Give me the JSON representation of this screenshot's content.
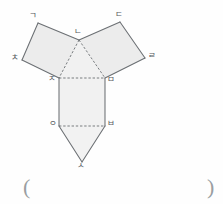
{
  "figure": {
    "kind": "net-of-solid-diagram",
    "stroke_color": "#6b6f73",
    "fill_color": "#ececec",
    "dashed_stroke_color": "#6b6f73",
    "label_color": "#54585c",
    "vertices": {
      "g": {
        "label": "ㄱ",
        "x": 38,
        "y": 23,
        "lx": 30,
        "ly": 12
      },
      "n": {
        "label": "ㄴ",
        "x": 79,
        "y": 40,
        "lx": 75,
        "ly": 28
      },
      "d": {
        "label": "ㄷ",
        "x": 120,
        "y": 22,
        "lx": 116,
        "ly": 11
      },
      "r": {
        "label": "ㄹ",
        "x": 145,
        "y": 58,
        "lx": 149,
        "ly": 52
      },
      "m": {
        "label": "ㅁ",
        "x": 105,
        "y": 78,
        "lx": 108,
        "ly": 79
      },
      "b": {
        "label": "ㅂ",
        "x": 105,
        "y": 126,
        "lx": 108,
        "ly": 120
      },
      "s": {
        "label": "ㅅ",
        "x": 82,
        "y": 162,
        "lx": 77,
        "ly": 160
      },
      "o": {
        "label": "ㅇ",
        "x": 59,
        "y": 126,
        "lx": 50,
        "ly": 120
      },
      "j": {
        "label": "ㅈ",
        "x": 59,
        "y": 78,
        "lx": 49,
        "ly": 77
      },
      "ch": {
        "label": "ㅊ",
        "x": 22,
        "y": 60,
        "lx": 12,
        "ly": 54
      }
    },
    "faces": [
      {
        "name": "left-parallelogram",
        "points": "38,23 79,40 59,78 22,60"
      },
      {
        "name": "right-parallelogram",
        "points": "120,22 145,58 105,78 79,40"
      },
      {
        "name": "center-triangle",
        "points": "79,40 59,78 105,78"
      },
      {
        "name": "center-rectangle",
        "points": "59,78 105,78 105,126 59,126"
      },
      {
        "name": "bottom-triangle",
        "points": "59,126 105,126 82,162"
      }
    ],
    "solid_edges": [
      {
        "name": "edge-g-n",
        "x1": 38,
        "y1": 23,
        "x2": 79,
        "y2": 40
      },
      {
        "name": "edge-g-ch",
        "x1": 38,
        "y1": 23,
        "x2": 22,
        "y2": 60
      },
      {
        "name": "edge-ch-j",
        "x1": 22,
        "y1": 60,
        "x2": 59,
        "y2": 78
      },
      {
        "name": "edge-n-d",
        "x1": 79,
        "y1": 40,
        "x2": 120,
        "y2": 22
      },
      {
        "name": "edge-d-r",
        "x1": 120,
        "y1": 22,
        "x2": 145,
        "y2": 58
      },
      {
        "name": "edge-r-m",
        "x1": 145,
        "y1": 58,
        "x2": 105,
        "y2": 78
      },
      {
        "name": "edge-j-o",
        "x1": 59,
        "y1": 78,
        "x2": 59,
        "y2": 126
      },
      {
        "name": "edge-m-b",
        "x1": 105,
        "y1": 78,
        "x2": 105,
        "y2": 126
      },
      {
        "name": "edge-o-s",
        "x1": 59,
        "y1": 126,
        "x2": 82,
        "y2": 162
      },
      {
        "name": "edge-b-s",
        "x1": 105,
        "y1": 126,
        "x2": 82,
        "y2": 162
      }
    ],
    "dashed_edges": [
      {
        "name": "fold-n-j",
        "x1": 79,
        "y1": 40,
        "x2": 59,
        "y2": 78
      },
      {
        "name": "fold-n-m",
        "x1": 79,
        "y1": 40,
        "x2": 105,
        "y2": 78
      },
      {
        "name": "fold-j-m",
        "x1": 59,
        "y1": 78,
        "x2": 105,
        "y2": 78
      },
      {
        "name": "fold-o-b",
        "x1": 59,
        "y1": 126,
        "x2": 105,
        "y2": 126
      }
    ]
  },
  "answer": {
    "open_paren": "(",
    "close_paren": ")",
    "blank_value": ""
  }
}
